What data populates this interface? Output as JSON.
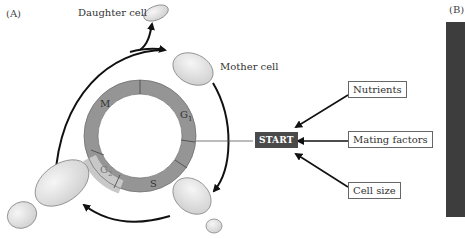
{
  "panels": {
    "a_label": "(A)",
    "b_label": "(B)"
  },
  "cells": {
    "daughter_label": "Daughter cell",
    "mother_label": "Mother cell"
  },
  "cycle": {
    "phases": [
      "M",
      "G1",
      "S",
      "G2"
    ],
    "checkpoint": "START"
  },
  "factors": [
    "Nutrients",
    "Mating factors",
    "Cell size"
  ],
  "colors": {
    "ring": "#959595",
    "ring_g2": "#c8c8c8",
    "start_box": "#4a4a4a",
    "cell_fill": "#e6e6e6",
    "micrograph": "#3d3d3d"
  }
}
